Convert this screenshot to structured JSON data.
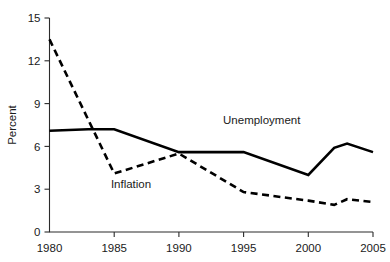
{
  "chart_data": {
    "type": "line",
    "title": "",
    "xlabel": "",
    "ylabel": "Percent",
    "xlim": [
      1980,
      2005
    ],
    "ylim": [
      0,
      15
    ],
    "grid": false,
    "legend_position": "inline-annotation",
    "x_ticks": [
      1980,
      1985,
      1990,
      1995,
      2000,
      2005
    ],
    "x_tick_labels": [
      "1980",
      "1985",
      "1990",
      "1995",
      "2000",
      "2005"
    ],
    "y_ticks": [
      0,
      3,
      6,
      9,
      12,
      15
    ],
    "y_tick_labels": [
      "0",
      "3",
      "6",
      "9",
      "12",
      "15"
    ],
    "series": [
      {
        "name": "Unemployment",
        "style": "solid",
        "color": "#000000",
        "label_x": 1996.4,
        "label_y": 7.6,
        "x": [
          1980,
          1983,
          1985,
          1990,
          1995,
          2000,
          2002,
          2003,
          2005
        ],
        "values": [
          7.1,
          7.2,
          7.2,
          5.6,
          5.6,
          4.0,
          5.9,
          6.2,
          5.6
        ]
      },
      {
        "name": "Inflation",
        "style": "dashed",
        "color": "#000000",
        "label_x": 1986.3,
        "label_y": 3.1,
        "x": [
          1980,
          1985,
          1990,
          1995,
          2000,
          2002,
          2003,
          2005
        ],
        "values": [
          13.5,
          4.1,
          5.5,
          2.8,
          2.2,
          1.9,
          2.3,
          2.1
        ]
      }
    ]
  }
}
